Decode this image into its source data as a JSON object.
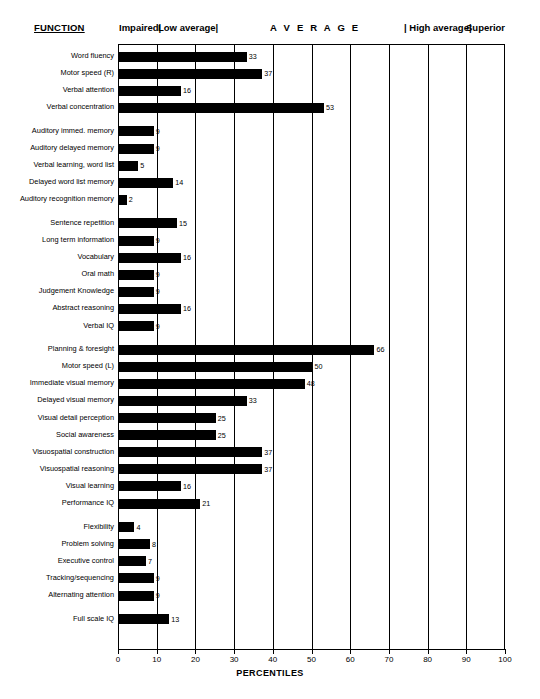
{
  "header": {
    "function_label": "FUNCTION",
    "bands": [
      {
        "name": "impaired",
        "label": "Impaired|"
      },
      {
        "name": "low-average",
        "label": "Low average|"
      },
      {
        "name": "average",
        "label": "A V E R A G E"
      },
      {
        "name": "high-average",
        "label": "| High average|"
      },
      {
        "name": "superior",
        "label": "Superior"
      }
    ]
  },
  "chart_data": {
    "type": "bar",
    "orientation": "horizontal",
    "title": "",
    "xlabel": "PERCENTILES",
    "ylabel": "FUNCTION",
    "xlim": [
      0,
      100
    ],
    "xticks": [
      0,
      10,
      20,
      30,
      40,
      50,
      60,
      70,
      80,
      90,
      100
    ],
    "grid": true,
    "grid_axis": "x",
    "legend": "none",
    "bar_color": "#000000",
    "annotations": [
      "Impaired|",
      "Low average|",
      "A V E R A G E",
      "| High average|",
      "Superior"
    ],
    "categories": [
      "Word fluency",
      "Motor speed (R)",
      "Verbal attention",
      "Verbal concentration",
      "Auditory immed. memory",
      "Auditory delayed memory",
      "Verbal learning, word list",
      "Delayed word list memory",
      "Auditory recognition memory",
      "Sentence repetition",
      "Long term information",
      "Vocabulary",
      "Oral math",
      "Judgement Knowledge",
      "Abstract reasoning",
      "Verbal IQ",
      "Planning & foresight",
      "Motor speed (L)",
      "Immediate visual memory",
      "Delayed visual memory",
      "Visual detail perception",
      "Social awareness",
      "Visuospatial construction",
      "Visuospatial reasoning",
      "Visual learning",
      "Performance IQ",
      "Flexibility",
      "Problem solving",
      "Executive control",
      "Tracking/sequencing",
      "Alternating attention",
      "Full scale IQ"
    ],
    "values": [
      33,
      37,
      16,
      53,
      9,
      9,
      5,
      14,
      2,
      15,
      9,
      16,
      9,
      9,
      16,
      9,
      66,
      50,
      48,
      33,
      25,
      25,
      37,
      37,
      16,
      21,
      4,
      8,
      7,
      9,
      9,
      13
    ],
    "groups": [
      {
        "start": 0,
        "end": 3
      },
      {
        "start": 4,
        "end": 8
      },
      {
        "start": 9,
        "end": 15
      },
      {
        "start": 16,
        "end": 25
      },
      {
        "start": 26,
        "end": 30
      },
      {
        "start": 31,
        "end": 31
      }
    ]
  }
}
